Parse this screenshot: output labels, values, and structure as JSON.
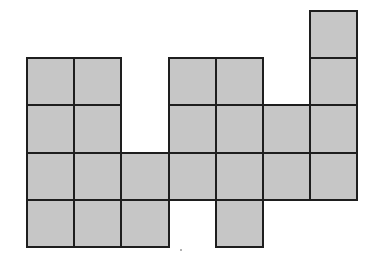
{
  "diagram": {
    "fill_color": "#c6c6c6",
    "stroke_color": "#1e1e1e",
    "origin_x": 27,
    "origin_y": 11,
    "cell_size": 47.2,
    "rows": [
      {
        "row": 0,
        "cols": [
          6
        ]
      },
      {
        "row": 1,
        "cols": [
          0,
          1,
          3,
          4,
          6
        ]
      },
      {
        "row": 2,
        "cols": [
          0,
          1,
          3,
          4,
          5,
          6
        ]
      },
      {
        "row": 3,
        "cols": [
          0,
          1,
          2,
          3,
          4,
          5,
          6
        ]
      },
      {
        "row": 4,
        "cols": [
          0,
          1,
          2,
          4
        ]
      }
    ],
    "tile_count": 23
  }
}
